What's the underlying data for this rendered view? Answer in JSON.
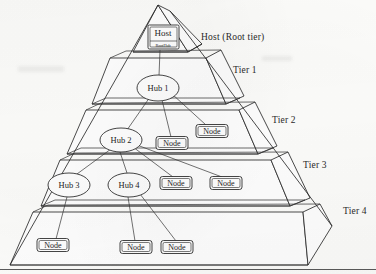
{
  "figure": {
    "type": "hierarchical-pyramid-diagram",
    "background_color": "#fdfdfb",
    "ink_color": "#222222"
  },
  "tier_labels": [
    {
      "name": "root-tier-label",
      "text": "Host (Root tier)",
      "x": 201,
      "y": 38
    },
    {
      "name": "tier-1-label",
      "text": "Tier 1",
      "x": 233,
      "y": 71
    },
    {
      "name": "tier-2-label",
      "text": "Tier 2",
      "x": 272,
      "y": 121
    },
    {
      "name": "tier-3-label",
      "text": "Tier 3",
      "x": 303,
      "y": 166
    },
    {
      "name": "tier-4-label",
      "text": "Tier 4",
      "x": 343,
      "y": 212
    }
  ],
  "host": {
    "label": "Host",
    "sub_label": "RootHub",
    "x": 163,
    "y": 37
  },
  "hubs": [
    {
      "label": "Hub 1",
      "x": 158,
      "y": 88,
      "rx": 21,
      "ry": 13
    },
    {
      "label": "Hub 2",
      "x": 121,
      "y": 140,
      "rx": 21,
      "ry": 12
    },
    {
      "label": "Hub 3",
      "x": 69,
      "y": 185,
      "rx": 21,
      "ry": 12
    },
    {
      "label": "Hub 4",
      "x": 129,
      "y": 185,
      "rx": 21,
      "ry": 12
    }
  ],
  "nodes": [
    {
      "label": "Node",
      "x": 172,
      "y": 143,
      "w": 32,
      "h": 13
    },
    {
      "label": "Node",
      "x": 212,
      "y": 131,
      "w": 32,
      "h": 13
    },
    {
      "label": "Node",
      "x": 176,
      "y": 183,
      "w": 32,
      "h": 13
    },
    {
      "label": "Node",
      "x": 226,
      "y": 183,
      "w": 32,
      "h": 13
    },
    {
      "label": "Node",
      "x": 53,
      "y": 245,
      "w": 32,
      "h": 13
    },
    {
      "label": "Node",
      "x": 136,
      "y": 247,
      "w": 32,
      "h": 13
    },
    {
      "label": "Node",
      "x": 177,
      "y": 247,
      "w": 32,
      "h": 13
    }
  ],
  "connections": [
    {
      "from": "host",
      "to": "Hub 1"
    },
    {
      "from": "Hub 1",
      "to": "Hub 2"
    },
    {
      "from": "Hub 1",
      "to": "Node-t2-a"
    },
    {
      "from": "Hub 1",
      "to": "Node-t2-b"
    },
    {
      "from": "Hub 2",
      "to": "Hub 3"
    },
    {
      "from": "Hub 2",
      "to": "Hub 4"
    },
    {
      "from": "Hub 2",
      "to": "Node-t3-a"
    },
    {
      "from": "Hub 2",
      "to": "Node-t3-b"
    },
    {
      "from": "Hub 3",
      "to": "Node-t4-a"
    },
    {
      "from": "Hub 4",
      "to": "Node-t4-b"
    },
    {
      "from": "Hub 4",
      "to": "Node-t4-c"
    }
  ]
}
